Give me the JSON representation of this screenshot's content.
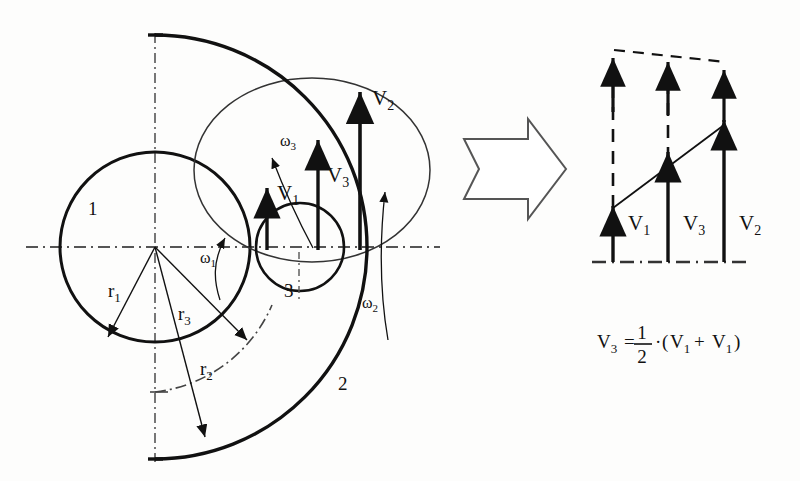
{
  "figure": {
    "background_color": "#fdfdfc",
    "line_color": "#111111"
  },
  "left_diagram": {
    "name": "kinematic-scheme",
    "body_labels": [
      {
        "id": "body-1",
        "text": "1",
        "x": 88,
        "y": 215
      },
      {
        "id": "body-2",
        "text": "2",
        "x": 338,
        "y": 390
      },
      {
        "id": "body-3",
        "text": "3",
        "x": 284,
        "y": 297
      }
    ],
    "radius_labels": [
      {
        "id": "r1",
        "base": "r",
        "sub": "1",
        "x": 108,
        "y": 297
      },
      {
        "id": "r2",
        "base": "r",
        "sub": "2",
        "x": 200,
        "y": 375
      },
      {
        "id": "r3",
        "base": "r",
        "sub": "3",
        "x": 178,
        "y": 320
      }
    ],
    "omega_labels": [
      {
        "id": "omega-1",
        "base": "ω",
        "sub": "1",
        "x": 200,
        "y": 263
      },
      {
        "id": "omega-2",
        "base": "ω",
        "sub": "2",
        "x": 362,
        "y": 308
      },
      {
        "id": "omega-3",
        "base": "ω",
        "sub": "3",
        "x": 280,
        "y": 146
      }
    ],
    "velocity_labels": [
      {
        "id": "v1",
        "base": "V",
        "sub": "1",
        "x": 277,
        "y": 200
      },
      {
        "id": "v2",
        "base": "V",
        "sub": "2",
        "x": 372,
        "y": 105
      },
      {
        "id": "v3",
        "base": "V",
        "sub": "3",
        "x": 327,
        "y": 182
      }
    ]
  },
  "transition": {
    "name": "block-arrow",
    "direction": "right"
  },
  "right_diagram": {
    "name": "velocity-triangle",
    "velocity_labels": [
      {
        "id": "v1",
        "base": "V",
        "sub": "1",
        "x": 630,
        "y": 228
      },
      {
        "id": "v3",
        "base": "V",
        "sub": "3",
        "x": 684,
        "y": 228
      },
      {
        "id": "v2",
        "base": "V",
        "sub": "2",
        "x": 740,
        "y": 228
      }
    ],
    "vectors": [
      {
        "id": "v1",
        "x": 613,
        "baseline_y": 262,
        "tip_y": 202,
        "dashed_tip_y": 48,
        "magnitude_rel": 0.28
      },
      {
        "id": "v3",
        "x": 668,
        "baseline_y": 262,
        "tip_y": 148,
        "dashed_tip_y": 52,
        "magnitude_rel": 0.53
      },
      {
        "id": "v2",
        "x": 724,
        "baseline_y": 262,
        "tip_y": 96,
        "dashed_tip_y": 60,
        "magnitude_rel": 0.78
      }
    ]
  },
  "formula": {
    "name": "velocity-relation",
    "text": "V3 = 1/2 · (V1 + V1)",
    "lhs_base": "V",
    "lhs_sub": "3",
    "equals": "=",
    "numerator": "1",
    "denominator": "2",
    "dot": "·",
    "open_paren": "(",
    "term1_base": "V",
    "term1_sub": "1",
    "plus": "+",
    "term2_base": "V",
    "term2_sub": "1",
    "close_paren": ")"
  }
}
